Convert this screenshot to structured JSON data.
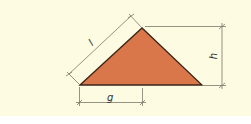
{
  "diagram": {
    "type": "triangle-dimension-diagram",
    "colors": {
      "background": "#fdfbe1",
      "triangle_fill": "#d9774a",
      "triangle_stroke": "#3a2418",
      "dimension_line": "#7a7a6a"
    },
    "labels": {
      "slant_length": "l",
      "height": "h",
      "base_offset": "g"
    }
  }
}
